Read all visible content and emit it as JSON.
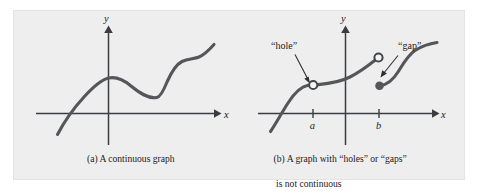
{
  "figure": {
    "background_color": "#eeeeee",
    "curve_color": "#55565a",
    "axis_color": "#3b3c40"
  },
  "panel_a": {
    "caption": "(a) A continuous graph",
    "x_axis_label": "x",
    "y_axis_label": "y"
  },
  "panel_b": {
    "caption_line_1": "(b) A graph with “holes” or “gaps”",
    "caption_line_2": "is not continuous",
    "x_axis_label": "x",
    "y_axis_label": "y",
    "tick_a_label": "a",
    "tick_b_label": "b",
    "callout_hole": "“hole”",
    "callout_gap": "“gap”"
  }
}
